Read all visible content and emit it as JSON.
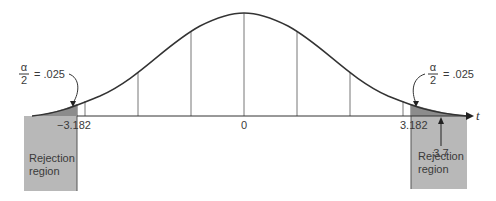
{
  "diagram": {
    "type": "t-distribution two-tailed rejection region",
    "axis_label": "t",
    "center_tick": "0",
    "left_critical": "−3.182",
    "right_critical": "3.182",
    "test_statistic": "3.7",
    "alpha_fraction": {
      "numerator": "α",
      "denominator": "2",
      "value": "= .025"
    },
    "rejection_left": {
      "line1": "Rejection",
      "line2": "region"
    },
    "rejection_right": {
      "line1": "Rejection",
      "line2": "region"
    },
    "colors": {
      "curve": "#333333",
      "shade": "#b5b5b5",
      "tail_shade": "#8a8a8a",
      "grid": "#666666"
    }
  }
}
